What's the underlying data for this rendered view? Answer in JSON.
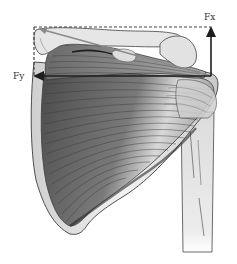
{
  "diagram": {
    "type": "anatomical-force-diagram",
    "labels": {
      "fx": "Fx",
      "fy": "Fy"
    },
    "vectors": [
      {
        "name": "Fx",
        "direction": "up",
        "from": [
          211,
          76
        ],
        "to": [
          211,
          27
        ]
      },
      {
        "name": "Fy",
        "direction": "left",
        "from": [
          211,
          76
        ],
        "to": [
          34,
          76
        ]
      },
      {
        "name": "resultant",
        "direction": "up-left",
        "from": [
          211,
          76
        ],
        "to": [
          38,
          28
        ]
      }
    ],
    "colors": {
      "arrow": "#2a2a2a",
      "dashed_box": "#444444",
      "bone": "#e4e4e4",
      "bone_outline": "#5a5a5a",
      "muscle_dark": "#5b5b5b",
      "muscle_light": "#bdbdbd",
      "label": "#333333"
    }
  }
}
